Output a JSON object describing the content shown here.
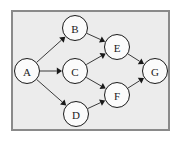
{
  "diagram": {
    "type": "directed-graph",
    "frame": {
      "x": 11,
      "y": 10,
      "width": 159,
      "height": 121,
      "border_color": "#8a8a8a",
      "background_color": "#ececec"
    },
    "style": {
      "node_fill": "#fbfbfb",
      "node_stroke": "#1a1a1a",
      "edge_color": "#3a3a3a",
      "label_color": "#1a1a1a",
      "node_radius": 12.5
    },
    "nodes": [
      {
        "id": "A",
        "label": "A",
        "cx": 27,
        "cy": 71,
        "r": 12.5
      },
      {
        "id": "B",
        "label": "B",
        "cx": 75,
        "cy": 28,
        "r": 12.5
      },
      {
        "id": "C",
        "label": "C",
        "cx": 75,
        "cy": 71,
        "r": 12.5
      },
      {
        "id": "D",
        "label": "D",
        "cx": 76,
        "cy": 114,
        "r": 12.5
      },
      {
        "id": "E",
        "label": "E",
        "cx": 117,
        "cy": 47,
        "r": 12.5
      },
      {
        "id": "F",
        "label": "F",
        "cx": 117,
        "cy": 95,
        "r": 12.5
      },
      {
        "id": "G",
        "label": "G",
        "cx": 155,
        "cy": 71,
        "r": 12.5
      }
    ],
    "edges": [
      {
        "from": "A",
        "to": "B",
        "directed": true
      },
      {
        "from": "A",
        "to": "C",
        "directed": true
      },
      {
        "from": "A",
        "to": "D",
        "directed": true
      },
      {
        "from": "B",
        "to": "E",
        "directed": true
      },
      {
        "from": "C",
        "to": "E",
        "directed": true
      },
      {
        "from": "C",
        "to": "F",
        "directed": true
      },
      {
        "from": "D",
        "to": "F",
        "directed": true
      },
      {
        "from": "E",
        "to": "G",
        "directed": true
      },
      {
        "from": "F",
        "to": "G",
        "directed": true
      }
    ]
  }
}
